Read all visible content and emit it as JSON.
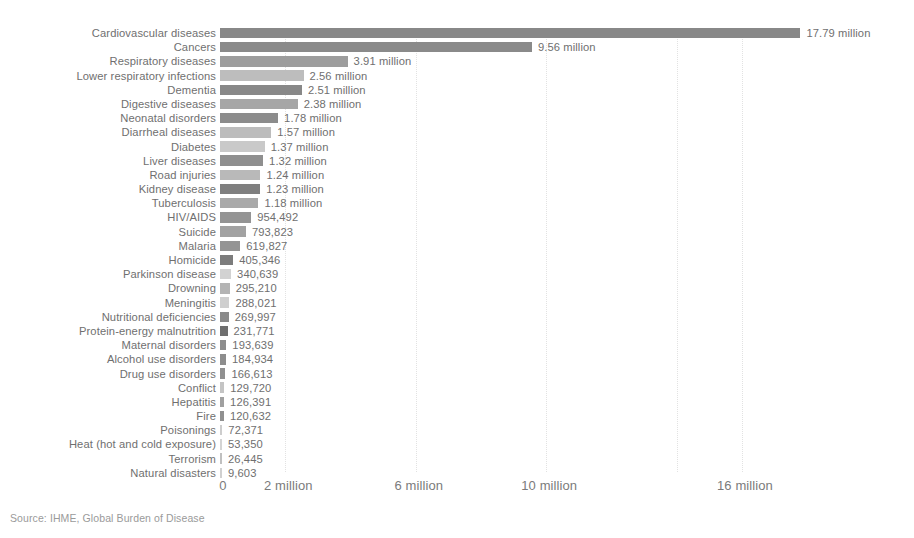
{
  "source_note": "Source: IHME, Global Burden of Disease",
  "axis": {
    "ticks": [
      {
        "label": "0",
        "value": 0
      },
      {
        "label": "2 million",
        "value": 2000000
      },
      {
        "label": "6 million",
        "value": 6000000
      },
      {
        "label": "10 million",
        "value": 10000000
      },
      {
        "label": "16 million",
        "value": 16000000
      }
    ],
    "gridline_values": [
      2000000,
      6000000,
      10000000,
      14000000,
      16000000
    ]
  },
  "chart_data": {
    "type": "bar",
    "orientation": "horizontal",
    "title": "",
    "subtitle": "",
    "xlabel": "",
    "ylabel": "",
    "xlim": [
      0,
      18500000
    ],
    "grid": true,
    "legend": null,
    "source": "Source: IHME, Global Burden of Disease",
    "axis_tick_labels": [
      "0",
      "2 million",
      "6 million",
      "10 million",
      "16 million"
    ],
    "axis_tick_values": [
      0,
      2000000,
      6000000,
      10000000,
      16000000
    ],
    "categories": [
      "Cardiovascular diseases",
      "Cancers",
      "Respiratory diseases",
      "Lower respiratory infections",
      "Dementia",
      "Digestive diseases",
      "Neonatal disorders",
      "Diarrheal diseases",
      "Diabetes",
      "Liver diseases",
      "Road injuries",
      "Kidney disease",
      "Tuberculosis",
      "HIV/AIDS",
      "Suicide",
      "Malaria",
      "Homicide",
      "Parkinson disease",
      "Drowning",
      "Meningitis",
      "Nutritional deficiencies",
      "Protein-energy malnutrition",
      "Maternal disorders",
      "Alcohol use disorders",
      "Drug use disorders",
      "Conflict",
      "Hepatitis",
      "Fire",
      "Poisonings",
      "Heat (hot and cold exposure)",
      "Terrorism",
      "Natural disasters"
    ],
    "values": [
      17790000,
      9560000,
      3910000,
      2560000,
      2510000,
      2380000,
      1780000,
      1570000,
      1370000,
      1320000,
      1240000,
      1230000,
      1180000,
      954492,
      793823,
      619827,
      405346,
      340639,
      295210,
      288021,
      269997,
      231771,
      193639,
      184934,
      166613,
      129720,
      126391,
      120632,
      72371,
      53350,
      26445,
      9603
    ],
    "value_labels": [
      "17.79 million",
      "9.56 million",
      "3.91 million",
      "2.56 million",
      "2.51 million",
      "2.38 million",
      "1.78 million",
      "1.57 million",
      "1.37 million",
      "1.32 million",
      "1.24 million",
      "1.23 million",
      "1.18 million",
      "954,492",
      "793,823",
      "619,827",
      "405,346",
      "340,639",
      "295,210",
      "288,021",
      "269,997",
      "231,771",
      "193,639",
      "184,934",
      "166,613",
      "129,720",
      "126,391",
      "120,632",
      "72,371",
      "53,350",
      "26,445",
      "9,603"
    ],
    "bar_colors": [
      "#888888",
      "#8a8a8a",
      "#9d9d9d",
      "#bdbdbd",
      "#888888",
      "#a6a6a6",
      "#8c8c8c",
      "#bcbcbc",
      "#c9c9c9",
      "#8f8f8f",
      "#b9b9b9",
      "#7f7f7f",
      "#a9a9a9",
      "#949494",
      "#a2a2a2",
      "#949494",
      "#7c7c7c",
      "#d2d2d2",
      "#b4b4b4",
      "#cfcfcf",
      "#8a8a8a",
      "#6f6f6f",
      "#8d8d8d",
      "#8d8d8d",
      "#909090",
      "#c4c4c4",
      "#a0a0a0",
      "#909090",
      "#cdcdcd",
      "#d4d4d4",
      "#c0c0c0",
      "#d0d0d0"
    ]
  }
}
